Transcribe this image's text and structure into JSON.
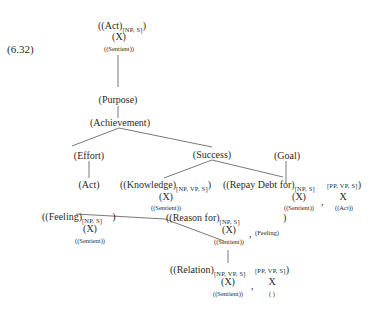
{
  "example_number": "(6.32)",
  "nodes": {
    "root": {
      "main": "((Act)",
      "sub": "[NP, S]",
      "close": ")",
      "x": "(X)",
      "role": "((Sentient))"
    },
    "purpose": "(Purpose)",
    "achievement": "(Achievement)",
    "effort": "(Effort)",
    "success": "(Success)",
    "act": "(Act)",
    "knowledge": {
      "main": "((Knowledge)",
      "sub": "[NP, VP, S]",
      "close": ")",
      "x": "(X)",
      "role": "((Sentient))"
    },
    "goal": "(Goal)",
    "repay": {
      "main": "((Repay Debt for)",
      "sub": "[NP, S]",
      "x": "(X)",
      "role": "((Sentient))",
      "comma": ",",
      "sub2": "[PP, VP, S]",
      "close": ")",
      "x2": "X",
      "role2": "((Act))"
    },
    "feeling": {
      "main": "((Feeling)",
      "sub": "[NP, S]",
      "close": ")",
      "x": "(X)",
      "role": "((Sentient))"
    },
    "reason": {
      "main": "((Reason for)",
      "sub": "[NP, S]",
      "x": "(X)",
      "role": "((Sentient))",
      "comma": ",",
      "extra": "(Feeling)",
      "close": ")"
    },
    "relation": {
      "main": "((Relation)",
      "sub": "[NP, VP, S]",
      "x": "(X)",
      "role": "((Sentient))",
      "comma": ",",
      "sub2": "[PP, VP, S]",
      "close": ")",
      "x2": "X",
      "role2": "( )"
    }
  }
}
